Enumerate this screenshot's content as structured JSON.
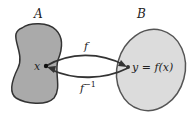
{
  "diagram": {
    "set_a": {
      "label": "A",
      "fill": "#aaaaaa",
      "stroke": "#333333"
    },
    "set_b": {
      "label": "B",
      "fill": "#dcdcdc",
      "stroke": "#555555"
    },
    "point_x": {
      "label": "x"
    },
    "point_y": {
      "label": "y = f(x)"
    },
    "arrow_forward": {
      "label": "f"
    },
    "arrow_inverse": {
      "label": "f",
      "superscript": "−1"
    }
  }
}
